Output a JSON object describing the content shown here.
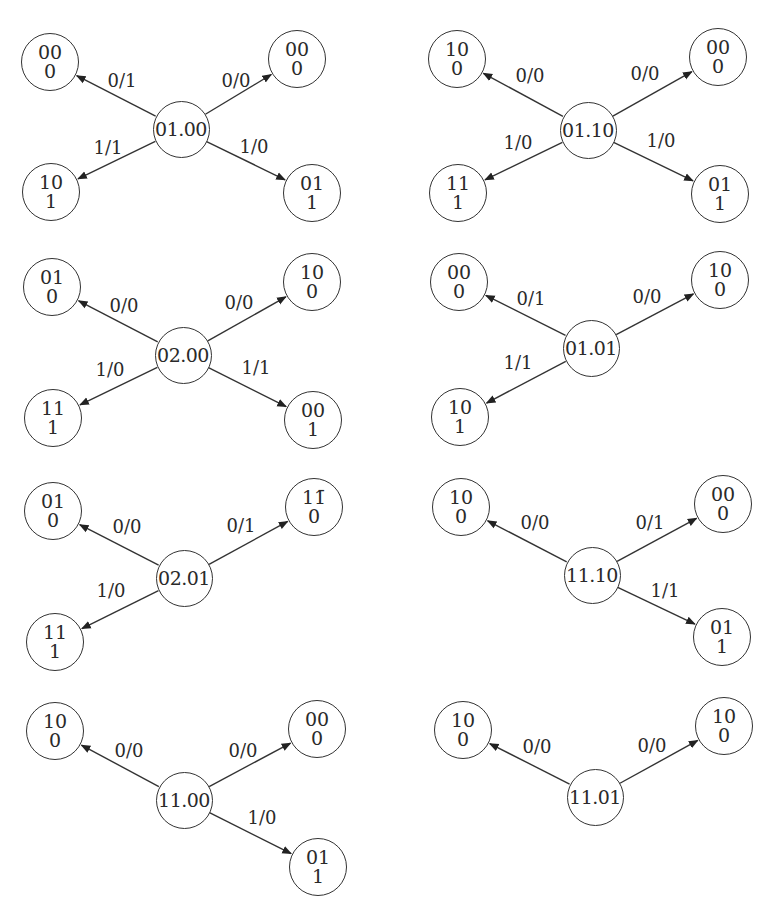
{
  "diagram": {
    "type": "state-transition-fragments",
    "panels": [
      {
        "id": "p1",
        "center": {
          "label": "01.00",
          "x": 181,
          "y": 129
        },
        "children": [
          {
            "top": "00",
            "bottom": "0",
            "x": 50,
            "y": 62,
            "edge": "0/1",
            "lx": 122,
            "ly": 80
          },
          {
            "top": "00",
            "bottom": "0",
            "x": 297,
            "y": 59,
            "edge": "0/0",
            "lx": 236,
            "ly": 80
          },
          {
            "top": "10",
            "bottom": "1",
            "x": 51,
            "y": 192,
            "edge": "1/1",
            "lx": 108,
            "ly": 147
          },
          {
            "top": "01",
            "bottom": "1",
            "x": 312,
            "y": 193,
            "edge": "1/0",
            "lx": 254,
            "ly": 146
          }
        ]
      },
      {
        "id": "p2",
        "center": {
          "label": "01.10",
          "x": 588,
          "y": 130
        },
        "children": [
          {
            "top": "10",
            "bottom": "0",
            "x": 457,
            "y": 59,
            "edge": "0/0",
            "lx": 530,
            "ly": 75
          },
          {
            "top": "00",
            "bottom": "0",
            "x": 718,
            "y": 57,
            "edge": "0/0",
            "lx": 645,
            "ly": 73
          },
          {
            "top": "11",
            "bottom": "1",
            "x": 458,
            "y": 193,
            "edge": "1/0",
            "lx": 518,
            "ly": 142
          },
          {
            "top": "01",
            "bottom": "1",
            "x": 720,
            "y": 194,
            "edge": "1/0",
            "lx": 661,
            "ly": 140
          }
        ]
      },
      {
        "id": "p3",
        "center": {
          "label": "02.00",
          "x": 183,
          "y": 355
        },
        "children": [
          {
            "top": "01",
            "bottom": "0",
            "x": 52,
            "y": 287,
            "edge": "0/0",
            "lx": 124,
            "ly": 305
          },
          {
            "top": "10",
            "bottom": "0",
            "x": 312,
            "y": 282,
            "edge": "0/0",
            "lx": 239,
            "ly": 302
          },
          {
            "top": "11",
            "bottom": "1",
            "x": 53,
            "y": 418,
            "edge": "1/0",
            "lx": 110,
            "ly": 369
          },
          {
            "top": "00",
            "bottom": "1",
            "x": 313,
            "y": 420,
            "edge": "1/1",
            "lx": 256,
            "ly": 367
          }
        ]
      },
      {
        "id": "p4",
        "center": {
          "label": "01.01",
          "x": 591,
          "y": 348
        },
        "children": [
          {
            "top": "00",
            "bottom": "0",
            "x": 459,
            "y": 282,
            "edge": "0/1",
            "lx": 531,
            "ly": 298
          },
          {
            "top": "10",
            "bottom": "0",
            "x": 720,
            "y": 280,
            "edge": "0/0",
            "lx": 647,
            "ly": 296
          },
          {
            "top": "10",
            "bottom": "1",
            "x": 460,
            "y": 417,
            "edge": "1/1",
            "lx": 518,
            "ly": 362
          }
        ]
      },
      {
        "id": "p5",
        "center": {
          "label": "02.01",
          "x": 184,
          "y": 578
        },
        "children": [
          {
            "top": "01",
            "bottom": "0",
            "x": 53,
            "y": 511,
            "edge": "0/0",
            "lx": 127,
            "ly": 526
          },
          {
            "top": "11̄",
            "bottom": "0",
            "x": 314,
            "y": 507,
            "edge": "0/1",
            "lx": 241,
            "ly": 525
          },
          {
            "top": "11",
            "bottom": "1",
            "x": 55,
            "y": 642,
            "edge": "1/0",
            "lx": 111,
            "ly": 590
          }
        ]
      },
      {
        "id": "p6",
        "center": {
          "label": "11.10",
          "x": 592,
          "y": 575
        },
        "children": [
          {
            "top": "10",
            "bottom": "0",
            "x": 461,
            "y": 507,
            "edge": "0/0",
            "lx": 535,
            "ly": 522
          },
          {
            "top": "00",
            "bottom": "0",
            "x": 723,
            "y": 504,
            "edge": "0/1",
            "lx": 650,
            "ly": 522
          },
          {
            "top": "01",
            "bottom": "1",
            "x": 722,
            "y": 637,
            "edge": "1/1",
            "lx": 665,
            "ly": 590
          }
        ]
      },
      {
        "id": "p7",
        "center": {
          "label": "11.00",
          "x": 184,
          "y": 800
        },
        "children": [
          {
            "top": "10",
            "bottom": "0",
            "x": 55,
            "y": 731,
            "edge": "0/0",
            "lx": 129,
            "ly": 750
          },
          {
            "top": "00",
            "bottom": "0",
            "x": 317,
            "y": 729,
            "edge": "0/0",
            "lx": 243,
            "ly": 750
          },
          {
            "top": "01",
            "bottom": "1",
            "x": 318,
            "y": 867,
            "edge": "1/0",
            "lx": 262,
            "ly": 817
          }
        ]
      },
      {
        "id": "p8",
        "center": {
          "label": "11.01",
          "x": 595,
          "y": 797
        },
        "children": [
          {
            "top": "10",
            "bottom": "0",
            "x": 463,
            "y": 730,
            "edge": "0/0",
            "lx": 537,
            "ly": 746
          },
          {
            "top": "10",
            "bottom": "0",
            "x": 724,
            "y": 726,
            "edge": "0/0",
            "lx": 652,
            "ly": 745
          }
        ]
      }
    ]
  },
  "style": {
    "stroke": "#333333",
    "text": "#2a2a2a",
    "background": "#ffffff"
  }
}
